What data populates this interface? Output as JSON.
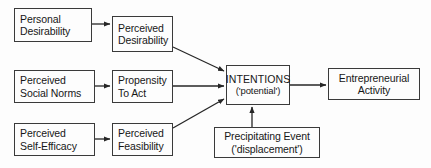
{
  "diagram": {
    "type": "flowchart",
    "background_color": "#fdfdfd",
    "border_color": "#3a3a3a",
    "text_color": "#171717",
    "nodes": [
      {
        "id": "personal-desirability",
        "line1": "Personal",
        "line2": "Desirability",
        "x": 14,
        "y": 8,
        "w": 78,
        "h": 34
      },
      {
        "id": "perceived-desirability",
        "line1": "Perceived",
        "line2": "Desirability",
        "x": 112,
        "y": 16,
        "w": 61,
        "h": 36
      },
      {
        "id": "perceived-social-norms",
        "line1": "Perceived",
        "line2": "Social Norms",
        "x": 14,
        "y": 70,
        "w": 81,
        "h": 33
      },
      {
        "id": "propensity-to-act",
        "line1": "Propensity",
        "line2": "To Act",
        "x": 112,
        "y": 70,
        "w": 61,
        "h": 33
      },
      {
        "id": "perceived-self-efficacy",
        "line1": "Perceived",
        "line2": "Self-Efficacy",
        "x": 14,
        "y": 123,
        "w": 81,
        "h": 33
      },
      {
        "id": "perceived-feasibility",
        "line1": "Perceived",
        "line2": "Feasibility",
        "x": 112,
        "y": 123,
        "w": 61,
        "h": 33
      },
      {
        "id": "intentions",
        "line1": "INTENTIONS",
        "line2": "('potential')",
        "x": 226,
        "y": 65,
        "w": 64,
        "h": 40
      },
      {
        "id": "precipitating-event",
        "line1": "Precipitating Event",
        "line2": "('displacement')",
        "x": 214,
        "y": 127,
        "w": 106,
        "h": 31
      },
      {
        "id": "entrepreneurial-activity",
        "line1": "Entrepreneurial",
        "line2": "Activity",
        "x": 328,
        "y": 68,
        "w": 92,
        "h": 32
      }
    ],
    "edges": [
      {
        "id": "personal-desirability-to-perceived-desirability",
        "from": "personal-desirability",
        "to": "perceived-desirability",
        "path": "M 92,24 L 110,24"
      },
      {
        "id": "perceived-desirability-to-intentions",
        "from": "perceived-desirability",
        "to": "intentions",
        "path": "M 173,47 L 224,71"
      },
      {
        "id": "perceived-social-norms-to-propensity-to-act",
        "from": "perceived-social-norms",
        "to": "propensity-to-act",
        "path": "M 95,86 L 110,86"
      },
      {
        "id": "propensity-to-act-to-intentions",
        "from": "propensity-to-act",
        "to": "intentions",
        "path": "M 173,86 L 224,86"
      },
      {
        "id": "perceived-self-efficacy-to-perceived-feasibility",
        "from": "perceived-self-efficacy",
        "to": "perceived-feasibility",
        "path": "M 95,139 L 110,139"
      },
      {
        "id": "perceived-feasibility-to-intentions",
        "from": "perceived-feasibility",
        "to": "intentions",
        "path": "M 173,128 L 224,99"
      },
      {
        "id": "precipitating-event-to-intentions",
        "from": "precipitating-event",
        "to": "intentions",
        "path": "M 252,127 L 252,107"
      },
      {
        "id": "intentions-to-entrepreneurial-activity",
        "from": "intentions",
        "to": "entrepreneurial-activity",
        "path": "M 290,85 L 326,85"
      }
    ]
  }
}
